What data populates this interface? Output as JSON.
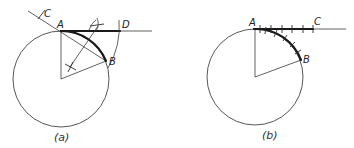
{
  "figure_a": {
    "caption": "(a)",
    "labels": {
      "A": "A",
      "B": "B",
      "C": "C",
      "D": "D"
    },
    "description": "Approximate rectification of arc AB: chord AB extended back to C, arc centered at C with radius CB swung to D on tangent at A; AD approximates arc AB"
  },
  "figure_b": {
    "caption": "(b)",
    "labels": {
      "A": "A",
      "B": "B",
      "C": "C"
    },
    "description": "Arc AB stepped off in small equal chords with dividers and transferred along tangent line from A to C"
  },
  "colors": {
    "line": "#3a3a3a",
    "heavy": "#1a1a1a",
    "background": "#ffffff"
  }
}
